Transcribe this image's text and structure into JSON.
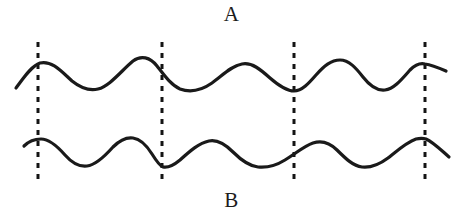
{
  "figure": {
    "title_top_label": "A",
    "title_bottom_label": "B",
    "background_color": "#ffffff",
    "stroke_color": "#1a1a1a",
    "dash_color": "#141414",
    "width": 463,
    "height": 221
  },
  "chart_data": {
    "type": "line",
    "title": "",
    "subtitle": "",
    "xlabel": "",
    "ylabel": "",
    "grid": false,
    "legend": "none",
    "axis_visible": false,
    "xlim": [
      0,
      463
    ],
    "ylim": [
      221,
      0
    ],
    "annotations": [
      {
        "name": "label-a",
        "text": "A",
        "x": 234,
        "y": 15
      },
      {
        "name": "label-b",
        "text": "B",
        "x": 234,
        "y": 201
      }
    ],
    "reference_lines": [
      {
        "name": "dashed-line-1",
        "x": 38,
        "y_top": 42,
        "y_bottom": 184,
        "style": "dashed"
      },
      {
        "name": "dashed-line-2",
        "x": 162,
        "y_top": 42,
        "y_bottom": 184,
        "style": "dashed"
      },
      {
        "name": "dashed-line-3",
        "x": 294,
        "y_top": 42,
        "y_bottom": 184,
        "style": "dashed"
      },
      {
        "name": "dashed-line-4",
        "x": 425,
        "y_top": 42,
        "y_bottom": 184,
        "style": "dashed"
      }
    ],
    "series": [
      {
        "name": "A",
        "label": "A",
        "stroke_width": 3.2,
        "baseline_y": 74,
        "path": "M 16,88 C 23,79 31,66 40,63 C 52,60 62,72 72,81 C 82,89 90,91 98,89 C 110,86 122,70 133,61 C 141,55 150,57 157,66 C 164,75 171,85 180,89 C 191,93 202,90 212,83 C 222,76 231,66 242,64 C 252,62 261,70 270,78 C 278,85 286,91 294,91 C 302,91 309,83 316,75 C 324,66 331,60 340,60 C 349,60 356,68 363,77 C 370,86 377,91 385,90 C 394,89 402,79 410,70 C 416,64 421,63 425,64 C 432,65 439,68 446,71",
        "keypoints": [
          {
            "x": 16,
            "y": 88,
            "type": "start"
          },
          {
            "x": 40,
            "y": 63,
            "type": "peak"
          },
          {
            "x": 97,
            "y": 89,
            "type": "trough"
          },
          {
            "x": 134,
            "y": 60,
            "type": "peak"
          },
          {
            "x": 194,
            "y": 91,
            "type": "trough"
          },
          {
            "x": 240,
            "y": 63,
            "type": "peak"
          },
          {
            "x": 294,
            "y": 91,
            "type": "trough"
          },
          {
            "x": 338,
            "y": 60,
            "type": "peak"
          },
          {
            "x": 386,
            "y": 90,
            "type": "trough"
          },
          {
            "x": 425,
            "y": 64,
            "type": "peak"
          },
          {
            "x": 446,
            "y": 71,
            "type": "end"
          }
        ]
      },
      {
        "name": "B",
        "label": "B",
        "stroke_width": 3.2,
        "baseline_y": 152,
        "path": "M 24,146 C 29,141 34,139 41,139 C 50,139 58,147 65,155 C 72,163 79,167 87,166 C 96,165 105,156 113,147 C 120,140 126,137 133,138 C 141,139 147,146 152,154 C 157,162 160,166 163,167 C 168,168 174,165 180,160 C 190,151 199,143 209,141 C 218,139 226,145 233,152 C 241,160 249,166 258,167 C 268,168 277,165 285,160 C 295,154 304,146 313,143 C 322,140 330,143 337,150 C 345,158 353,166 362,167 C 371,168 380,164 388,158 C 398,150 407,142 416,139 C 420,138 423,138 426,139 C 433,142 441,150 449,157",
        "keypoints": [
          {
            "x": 24,
            "y": 146,
            "type": "start"
          },
          {
            "x": 41,
            "y": 139,
            "type": "peak"
          },
          {
            "x": 87,
            "y": 166,
            "type": "trough"
          },
          {
            "x": 130,
            "y": 137,
            "type": "peak"
          },
          {
            "x": 163,
            "y": 167,
            "type": "trough"
          },
          {
            "x": 212,
            "y": 140,
            "type": "peak"
          },
          {
            "x": 259,
            "y": 167,
            "type": "trough"
          },
          {
            "x": 311,
            "y": 142,
            "type": "peak"
          },
          {
            "x": 363,
            "y": 167,
            "type": "trough"
          },
          {
            "x": 425,
            "y": 139,
            "type": "peak"
          },
          {
            "x": 449,
            "y": 157,
            "type": "end"
          }
        ]
      }
    ]
  }
}
